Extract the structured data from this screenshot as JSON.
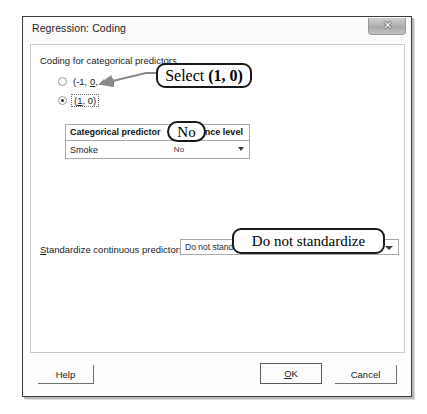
{
  "window": {
    "title": "Regression: Coding",
    "close_icon": "close-icon",
    "close_glyph": "✕"
  },
  "coding_group": {
    "label": "Coding for categorical predictors",
    "options": [
      {
        "label_pre": "(-1, ",
        "label_accel": "0",
        "label_post": ", +1)",
        "selected": false
      },
      {
        "label_pre": "(",
        "label_accel": "1",
        "label_post": ", 0)",
        "selected": true
      }
    ]
  },
  "table": {
    "headers": [
      "Categorical predictor",
      "Reference level"
    ],
    "rows": [
      {
        "predictor": "Smoke",
        "reference_level": "No"
      }
    ],
    "dropdown_icon": "chevron-down-icon"
  },
  "standardize": {
    "label_accel": "S",
    "label_rest": "tandardize continuous predictors:",
    "value": "Do not standardize",
    "dropdown_icon": "chevron-down-icon"
  },
  "buttons": {
    "help": "Help",
    "ok_accel": "O",
    "ok_rest": "K",
    "cancel": "Cancel"
  },
  "annotations": {
    "select_pre": "Select ",
    "select_bold": "(1, 0)",
    "no": "No",
    "standardize": "Do not standardize"
  },
  "colors": {
    "dialog_border": "#3b3b3b",
    "panel_border": "#c9c9c9",
    "annotation": "#1a1a1a",
    "text": "#1d1d1d"
  }
}
